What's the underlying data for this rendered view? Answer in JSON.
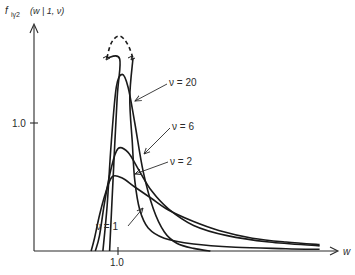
{
  "chart_data": {
    "type": "line",
    "title": "",
    "ylabel": "f_{iγ2}(w | 1, ν)",
    "xlabel": "w",
    "x_ticks": [
      {
        "value": 1.0,
        "label": "1.0"
      }
    ],
    "y_ticks": [
      {
        "value": 1.0,
        "label": "1.0"
      }
    ],
    "xlim": [
      0,
      3.6
    ],
    "ylim": [
      0,
      1.75
    ],
    "grid": false,
    "legend": "inline annotations with arrows",
    "series": [
      {
        "name": "ν = 1",
        "label": "ν = 1",
        "x": [
          0.68,
          0.72,
          0.78,
          0.85,
          0.93,
          1.05,
          1.2,
          1.4,
          1.6,
          1.9,
          2.2,
          2.6,
          3.0,
          3.4
        ],
        "y": [
          0.0,
          0.1,
          0.28,
          0.45,
          0.58,
          0.57,
          0.5,
          0.41,
          0.32,
          0.23,
          0.16,
          0.1,
          0.07,
          0.05
        ]
      },
      {
        "name": "ν = 2",
        "label": "ν = 2",
        "x": [
          0.73,
          0.78,
          0.84,
          0.92,
          1.0,
          1.12,
          1.25,
          1.4,
          1.6,
          1.9,
          2.3,
          2.8,
          3.4
        ],
        "y": [
          0.0,
          0.12,
          0.38,
          0.65,
          0.8,
          0.77,
          0.63,
          0.47,
          0.33,
          0.2,
          0.12,
          0.07,
          0.04
        ]
      },
      {
        "name": "ν = 6",
        "label": "ν = 6",
        "x": [
          0.82,
          0.87,
          0.92,
          0.98,
          1.05,
          1.12,
          1.2,
          1.3,
          1.42,
          1.55,
          1.7,
          1.9,
          2.1
        ],
        "y": [
          0.0,
          0.35,
          0.85,
          1.28,
          1.38,
          1.28,
          1.0,
          0.62,
          0.33,
          0.15,
          0.06,
          0.02,
          0.0
        ]
      },
      {
        "name": "ν = 20",
        "label": "ν = 20",
        "x": [
          0.9,
          0.94,
          0.98,
          1.01,
          1.04,
          1.08,
          1.12,
          1.15,
          1.18,
          1.23,
          1.28,
          1.35,
          1.45,
          1.6,
          1.8,
          2.1,
          2.5,
          3.0,
          3.4
        ],
        "y": [
          0.0,
          0.6,
          1.25,
          1.5,
          1.68,
          1.68,
          1.5,
          1.28,
          0.95,
          0.62,
          0.42,
          0.28,
          0.18,
          0.12,
          0.08,
          0.05,
          0.03,
          0.02,
          0.01
        ],
        "dashed_top": true
      }
    ],
    "annotations": [
      {
        "text": "ν = 20",
        "points_to_series": "ν = 20"
      },
      {
        "text": "ν = 6",
        "points_to_series": "ν = 6"
      },
      {
        "text": "ν = 2",
        "points_to_series": "ν = 2"
      },
      {
        "text": "ν = 1",
        "points_to_series": "ν = 1"
      }
    ]
  },
  "axes": {
    "y_label_main": "f",
    "y_label_sub": "iγ2",
    "y_label_args": "(w | 1, ν)",
    "x_label": "w",
    "x_tick_label": "1.0",
    "y_tick_label": "1.0"
  },
  "labels": {
    "nu20": "ν = 20",
    "nu6": "ν = 6",
    "nu2": "ν = 2",
    "nu1": "ν = 1"
  }
}
